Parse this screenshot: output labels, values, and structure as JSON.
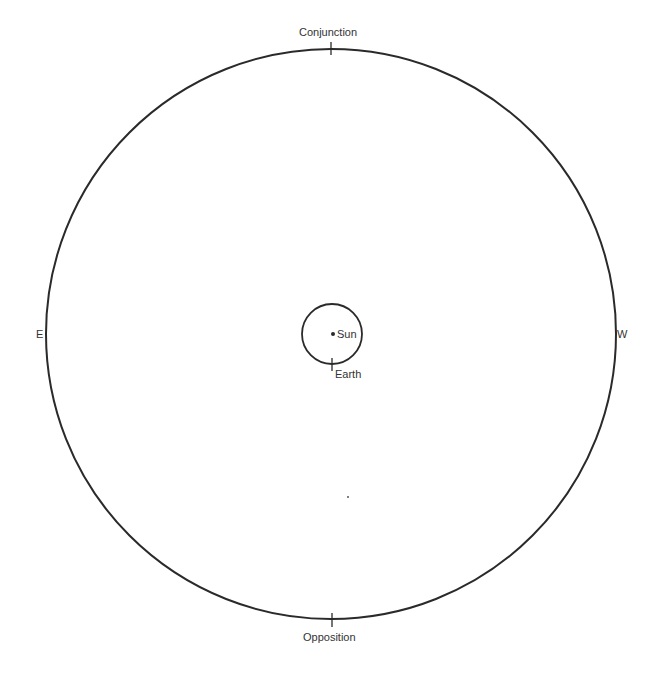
{
  "diagram": {
    "type": "orbital-configuration",
    "labels": {
      "top": "Conjunction",
      "bottom": "Opposition",
      "left": "E",
      "right": "W",
      "sun": "Sun",
      "earth": "Earth"
    },
    "outer_orbit": {
      "cx": 331,
      "cy": 334,
      "r": 285
    },
    "inner_orbit": {
      "cx": 332,
      "cy": 334,
      "r": 30
    },
    "sun_position": {
      "x": 333,
      "y": 334
    },
    "earth_position": {
      "x": 332,
      "y": 364
    },
    "stray_point": {
      "x": 348,
      "y": 497
    },
    "colors": {
      "line": "#2a2a2a",
      "background": "#ffffff"
    }
  }
}
